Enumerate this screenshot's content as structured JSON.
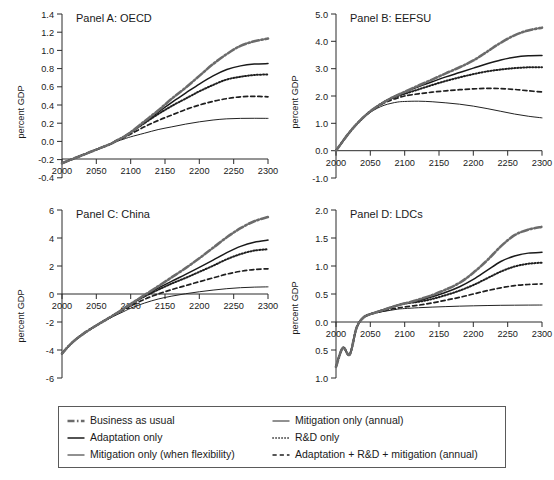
{
  "figure": {
    "yaxis_label": "percent GDP",
    "panels": [
      {
        "id": "panel-a",
        "title": "Panel A: OECD",
        "xticks": [
          "2000",
          "2050",
          "2100",
          "2150",
          "2200",
          "2250",
          "2300"
        ],
        "yticks": [
          "1.4",
          "1.2",
          "1.0",
          "0.8",
          "0.6",
          "0.4",
          "0.2",
          "0.0",
          "-0.2",
          "-0.4"
        ]
      },
      {
        "id": "panel-b",
        "title": "Panel B: EEFSU",
        "xticks": [
          "2000",
          "2050",
          "2100",
          "2150",
          "2200",
          "2250",
          "2300"
        ],
        "yticks": [
          "5.0",
          "4.0",
          "3.0",
          "2.0",
          "1.0",
          "0.0",
          "-1.0"
        ]
      },
      {
        "id": "panel-c",
        "title": "Panel C: China",
        "xticks": [
          "2000",
          "2050",
          "2100",
          "2150",
          "2200",
          "2250",
          "2300"
        ],
        "yticks": [
          "6",
          "4",
          "2",
          "0",
          "-2",
          "-4",
          "-6"
        ]
      },
      {
        "id": "panel-d",
        "title": "Panel D: LDCs",
        "xticks": [
          "2000",
          "2050",
          "2100",
          "2150",
          "2200",
          "2250",
          "2300"
        ],
        "yticks": [
          "2.0",
          "1.5",
          "1.0",
          "0.5",
          "0.0",
          "0.5",
          "1.0"
        ]
      }
    ]
  },
  "legend": {
    "entries": [
      {
        "label": "Business as usual",
        "style": "dashdot-thick",
        "color": "#555555"
      },
      {
        "label": "Mitigation only (annual)",
        "style": "solid-thin",
        "color": "#222222"
      },
      {
        "label": "Adaptation only",
        "style": "solid-thick",
        "color": "#1a1a1a"
      },
      {
        "label": "R&D only",
        "style": "dotted",
        "color": "#222222"
      },
      {
        "label": "Mitigation only (when flexibility)",
        "style": "solid-thin",
        "color": "#222222"
      },
      {
        "label": "Adaptation + R&D + mitigation (annual)",
        "style": "dashed",
        "color": "#222222"
      }
    ]
  },
  "chart_data": {
    "type": "line",
    "xlabel": "",
    "ylabel": "percent GDP",
    "x": [
      2000,
      2010,
      2020,
      2030,
      2040,
      2050,
      2060,
      2070,
      2080,
      2090,
      2100,
      2120,
      2140,
      2160,
      2180,
      2200,
      2220,
      2240,
      2260,
      2280,
      2300
    ],
    "grid": false,
    "legend_position": "bottom",
    "panels": [
      {
        "name": "Panel A: OECD",
        "xlim": [
          2000,
          2300
        ],
        "ylim": [
          -0.4,
          1.4
        ],
        "xticks": [
          2000,
          2050,
          2100,
          2150,
          2200,
          2250,
          2300
        ],
        "yticks": [
          -0.4,
          -0.2,
          0.0,
          0.2,
          0.4,
          0.6,
          0.8,
          1.0,
          1.2,
          1.4
        ],
        "series": [
          {
            "name": "Business as usual",
            "values": [
              -0.24,
              -0.21,
              -0.18,
              -0.15,
              -0.12,
              -0.09,
              -0.06,
              -0.03,
              0.01,
              0.05,
              0.1,
              0.22,
              0.34,
              0.47,
              0.59,
              0.72,
              0.85,
              0.96,
              1.05,
              1.1,
              1.13
            ]
          },
          {
            "name": "Adaptation only",
            "values": [
              -0.24,
              -0.21,
              -0.18,
              -0.15,
              -0.12,
              -0.09,
              -0.06,
              -0.03,
              0.01,
              0.05,
              0.1,
              0.21,
              0.32,
              0.43,
              0.53,
              0.63,
              0.72,
              0.79,
              0.83,
              0.85,
              0.855
            ]
          },
          {
            "name": "R&D only",
            "values": [
              -0.24,
              -0.21,
              -0.18,
              -0.15,
              -0.12,
              -0.09,
              -0.06,
              -0.03,
              0.01,
              0.05,
              0.1,
              0.2,
              0.3,
              0.39,
              0.47,
              0.55,
              0.62,
              0.68,
              0.71,
              0.73,
              0.735
            ]
          },
          {
            "name": "Adaptation + R&D + mitigation (annual)",
            "values": [
              -0.24,
              -0.21,
              -0.18,
              -0.15,
              -0.12,
              -0.09,
              -0.06,
              -0.03,
              0.01,
              0.04,
              0.08,
              0.16,
              0.23,
              0.29,
              0.35,
              0.4,
              0.44,
              0.47,
              0.49,
              0.495,
              0.49
            ]
          },
          {
            "name": "Mitigation only (when flexibility)",
            "values": [
              -0.24,
              -0.21,
              -0.18,
              -0.15,
              -0.12,
              -0.09,
              -0.06,
              -0.035,
              0.0,
              0.025,
              0.05,
              0.09,
              0.13,
              0.16,
              0.19,
              0.215,
              0.235,
              0.248,
              0.253,
              0.254,
              0.253
            ]
          }
        ]
      },
      {
        "name": "Panel B: EEFSU",
        "xlim": [
          2000,
          2300
        ],
        "ylim": [
          -1.0,
          5.0
        ],
        "xticks": [
          2000,
          2050,
          2100,
          2150,
          2200,
          2250,
          2300
        ],
        "yticks": [
          -1.0,
          0.0,
          1.0,
          2.0,
          3.0,
          4.0,
          5.0
        ],
        "series": [
          {
            "name": "Business as usual",
            "values": [
              0.0,
              0.35,
              0.68,
              0.97,
              1.22,
              1.44,
              1.62,
              1.78,
              1.92,
              2.04,
              2.15,
              2.38,
              2.6,
              2.83,
              3.05,
              3.3,
              3.62,
              3.95,
              4.22,
              4.4,
              4.5
            ]
          },
          {
            "name": "Adaptation only",
            "values": [
              0.0,
              0.35,
              0.68,
              0.97,
              1.22,
              1.44,
              1.62,
              1.78,
              1.92,
              2.04,
              2.15,
              2.34,
              2.52,
              2.7,
              2.86,
              3.02,
              3.18,
              3.32,
              3.42,
              3.47,
              3.48
            ]
          },
          {
            "name": "R&D only",
            "values": [
              0.0,
              0.35,
              0.68,
              0.97,
              1.22,
              1.44,
              1.62,
              1.78,
              1.9,
              2.0,
              2.08,
              2.24,
              2.4,
              2.55,
              2.68,
              2.8,
              2.9,
              2.97,
              3.02,
              3.05,
              3.05
            ]
          },
          {
            "name": "Adaptation + R&D + mitigation (annual)",
            "values": [
              0.0,
              0.35,
              0.68,
              0.97,
              1.22,
              1.44,
              1.6,
              1.74,
              1.85,
              1.93,
              2.0,
              2.08,
              2.14,
              2.19,
              2.23,
              2.26,
              2.28,
              2.27,
              2.24,
              2.19,
              2.15
            ]
          },
          {
            "name": "Mitigation only (when flexibility)",
            "values": [
              0.0,
              0.35,
              0.68,
              0.97,
              1.2,
              1.4,
              1.55,
              1.66,
              1.73,
              1.78,
              1.8,
              1.81,
              1.79,
              1.75,
              1.7,
              1.63,
              1.54,
              1.44,
              1.34,
              1.26,
              1.2
            ]
          }
        ]
      },
      {
        "name": "Panel C: China",
        "xlim": [
          2000,
          2300
        ],
        "ylim": [
          -6,
          6
        ],
        "xticks": [
          2000,
          2050,
          2100,
          2150,
          2200,
          2250,
          2300
        ],
        "yticks": [
          -6,
          -4,
          -2,
          0,
          2,
          4,
          6
        ],
        "series": [
          {
            "name": "Business as usual",
            "values": [
              -4.25,
              -3.7,
              -3.25,
              -2.88,
              -2.55,
              -2.25,
              -1.95,
              -1.66,
              -1.36,
              -1.05,
              -0.72,
              -0.08,
              0.55,
              1.2,
              1.85,
              2.55,
              3.3,
              4.05,
              4.7,
              5.2,
              5.5
            ]
          },
          {
            "name": "Adaptation only",
            "values": [
              -4.25,
              -3.7,
              -3.25,
              -2.88,
              -2.55,
              -2.25,
              -1.95,
              -1.66,
              -1.36,
              -1.05,
              -0.72,
              -0.12,
              0.42,
              0.92,
              1.4,
              1.9,
              2.42,
              2.95,
              3.4,
              3.7,
              3.85
            ]
          },
          {
            "name": "R&D only",
            "values": [
              -4.25,
              -3.7,
              -3.25,
              -2.88,
              -2.55,
              -2.25,
              -1.95,
              -1.66,
              -1.36,
              -1.05,
              -0.72,
              -0.18,
              0.3,
              0.75,
              1.15,
              1.58,
              2.02,
              2.48,
              2.85,
              3.1,
              3.2
            ]
          },
          {
            "name": "Adaptation + R&D + mitigation (annual)",
            "values": [
              -4.25,
              -3.7,
              -3.25,
              -2.88,
              -2.55,
              -2.25,
              -1.95,
              -1.68,
              -1.4,
              -1.12,
              -0.85,
              -0.38,
              0.0,
              0.32,
              0.6,
              0.88,
              1.15,
              1.42,
              1.62,
              1.75,
              1.8
            ]
          },
          {
            "name": "Mitigation only (when flexibility)",
            "values": [
              -4.25,
              -3.7,
              -3.25,
              -2.88,
              -2.55,
              -2.25,
              -1.98,
              -1.72,
              -1.48,
              -1.25,
              -1.02,
              -0.65,
              -0.36,
              -0.15,
              0.02,
              0.16,
              0.28,
              0.38,
              0.45,
              0.49,
              0.51
            ]
          }
        ]
      },
      {
        "name": "Panel D: LDCs",
        "xlim": [
          2000,
          2300
        ],
        "ylim": [
          -1.0,
          2.0
        ],
        "xticks": [
          2000,
          2050,
          2100,
          2150,
          2200,
          2250,
          2300
        ],
        "yticks": [
          -1.0,
          -0.5,
          0.0,
          0.5,
          1.0,
          1.5,
          2.0
        ],
        "note": "Curves begin with a jagged oscillation between 2000 and 2035, dipping to about -0.75",
        "series": [
          {
            "name": "Business as usual",
            "values": [
              -0.8,
              -0.46,
              -0.58,
              -0.1,
              0.08,
              0.14,
              0.18,
              0.22,
              0.26,
              0.3,
              0.33,
              0.4,
              0.48,
              0.58,
              0.7,
              0.88,
              1.1,
              1.35,
              1.55,
              1.65,
              1.7
            ]
          },
          {
            "name": "Adaptation only",
            "values": [
              -0.8,
              -0.46,
              -0.58,
              -0.1,
              0.08,
              0.14,
              0.18,
              0.22,
              0.26,
              0.3,
              0.33,
              0.38,
              0.45,
              0.53,
              0.63,
              0.76,
              0.92,
              1.08,
              1.18,
              1.23,
              1.245
            ]
          },
          {
            "name": "R&D only",
            "values": [
              -0.8,
              -0.46,
              -0.58,
              -0.1,
              0.08,
              0.14,
              0.18,
              0.22,
              0.26,
              0.3,
              0.33,
              0.36,
              0.41,
              0.48,
              0.56,
              0.66,
              0.78,
              0.9,
              0.99,
              1.04,
              1.06
            ]
          },
          {
            "name": "Adaptation + R&D + mitigation (annual)",
            "values": [
              -0.8,
              -0.46,
              -0.58,
              -0.1,
              0.08,
              0.14,
              0.17,
              0.2,
              0.23,
              0.25,
              0.27,
              0.3,
              0.34,
              0.39,
              0.44,
              0.5,
              0.56,
              0.61,
              0.65,
              0.67,
              0.68
            ]
          },
          {
            "name": "Mitigation only (when flexibility)",
            "values": [
              -0.8,
              -0.46,
              -0.58,
              -0.1,
              0.08,
              0.14,
              0.17,
              0.19,
              0.21,
              0.23,
              0.24,
              0.255,
              0.266,
              0.275,
              0.283,
              0.289,
              0.294,
              0.298,
              0.3,
              0.302,
              0.303
            ]
          }
        ]
      }
    ]
  }
}
